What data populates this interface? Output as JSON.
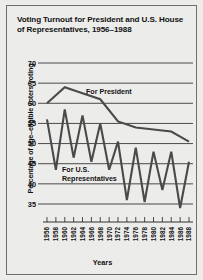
{
  "figure": {
    "title": "Voting Turnout for President and U.S. House of Representatives, 1956–1988",
    "xlabel": "Years",
    "ylabel": "Percentage of age–eligible voters voting",
    "annotation_president": "For President",
    "annotation_house_line1": "For U.S.",
    "annotation_house_line2": "Representatives",
    "line_color": "#4a4a4a",
    "grid_color": "#22201f",
    "background_color": "#ececeb"
  },
  "chart_data": {
    "type": "line",
    "title": "Voting Turnout for President and U.S. House of Representatives, 1956–1988",
    "xlabel": "Years",
    "ylabel": "Percentage of age-eligible voters voting",
    "x": [
      1956,
      1958,
      1960,
      1962,
      1964,
      1966,
      1968,
      1970,
      1972,
      1974,
      1976,
      1978,
      1980,
      1982,
      1984,
      1986,
      1988
    ],
    "xticklabels": [
      "1956",
      "1958",
      "1960",
      "1962",
      "1964",
      "1966",
      "1968",
      "1970",
      "1972",
      "1974",
      "1976",
      "1978",
      "1980",
      "1982",
      "1984",
      "1986",
      "1988"
    ],
    "yticklabels": [
      "35",
      "40",
      "45",
      "50",
      "55",
      "60",
      "65",
      "70"
    ],
    "yticks": [
      35,
      40,
      45,
      50,
      55,
      60,
      65,
      70
    ],
    "ylim": [
      32,
      72
    ],
    "xlim": [
      1955,
      1989
    ],
    "grid": true,
    "grid_axis": "y",
    "legend": "annotated-inline",
    "series": [
      {
        "name": "For President",
        "x": [
          1956,
          1960,
          1964,
          1968,
          1972,
          1976,
          1980,
          1984,
          1988
        ],
        "values": [
          60.0,
          64.0,
          62.5,
          61.0,
          55.5,
          54.0,
          53.5,
          53.0,
          50.5
        ]
      },
      {
        "name": "For U.S. Representatives",
        "x": [
          1956,
          1958,
          1960,
          1962,
          1964,
          1966,
          1968,
          1970,
          1972,
          1974,
          1976,
          1978,
          1980,
          1982,
          1984,
          1986,
          1988
        ],
        "values": [
          56.0,
          43.5,
          58.5,
          46.5,
          57.0,
          45.5,
          55.0,
          43.5,
          50.5,
          36.0,
          49.0,
          35.5,
          48.0,
          38.5,
          48.0,
          34.0,
          45.5
        ]
      }
    ]
  }
}
